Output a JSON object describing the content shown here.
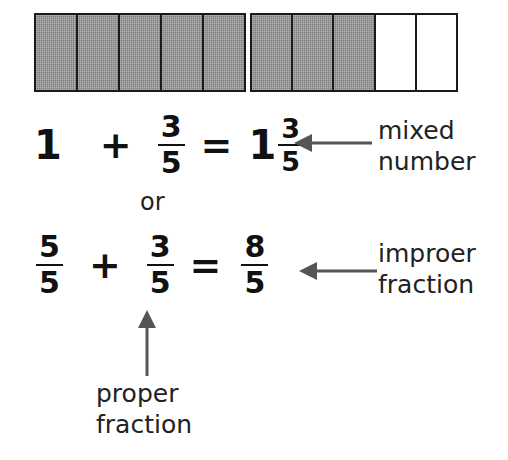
{
  "diagram": {
    "ink_color": "#1f1f1f",
    "shade_color": "#7d7d7d"
  },
  "models": {
    "left_bar": {
      "name": "one whole",
      "total_cells": 5,
      "shaded_cells": 5,
      "cells": [
        "shaded",
        "shaded",
        "shaded",
        "shaded",
        "shaded"
      ]
    },
    "right_bar": {
      "name": "three fifths",
      "total_cells": 5,
      "shaded_cells": 3,
      "cells": [
        "shaded",
        "shaded",
        "shaded",
        "empty",
        "empty"
      ]
    }
  },
  "equation_one": {
    "term1_whole": "1",
    "plus": "+",
    "term2_numerator": "3",
    "term2_denominator": "5",
    "equals": "=",
    "result_whole": "1",
    "result_numerator": "3",
    "result_denominator": "5"
  },
  "connector": {
    "or": "or"
  },
  "equation_two": {
    "term1_numerator": "5",
    "term1_denominator": "5",
    "plus": "+",
    "term2_numerator": "3",
    "term2_denominator": "5",
    "equals": "=",
    "result_numerator": "8",
    "result_denominator": "5"
  },
  "labels": {
    "mixed_number": "mixed\nnumber",
    "improper_fraction": "improer\nfraction",
    "proper_fraction": "proper\nfraction"
  }
}
